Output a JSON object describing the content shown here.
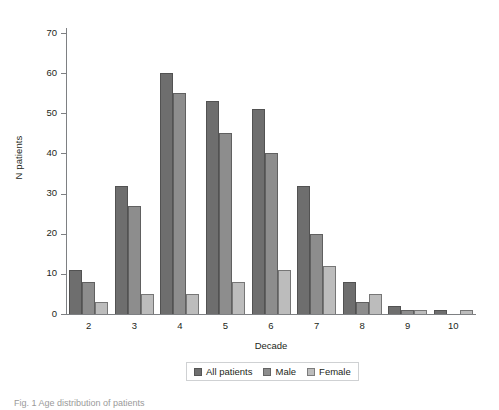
{
  "chart_data": {
    "type": "bar",
    "title": "",
    "subtitle": "",
    "xlabel": "Decade",
    "ylabel": "N patients",
    "categories": [
      "2",
      "3",
      "4",
      "5",
      "6",
      "7",
      "8",
      "9",
      "10"
    ],
    "series": [
      {
        "name": "All patients",
        "color": "#6e6e6e",
        "values": [
          11,
          32,
          60,
          53,
          51,
          32,
          8,
          2,
          1
        ]
      },
      {
        "name": "Male",
        "color": "#8d8d8d",
        "values": [
          8,
          27,
          55,
          45,
          40,
          20,
          3,
          1,
          0
        ]
      },
      {
        "name": "Female",
        "color": "#bcbcbc",
        "values": [
          3,
          5,
          5,
          8,
          11,
          12,
          5,
          1,
          1
        ]
      }
    ],
    "ylim": [
      0,
      70
    ],
    "yticks": [
      0,
      10,
      20,
      30,
      40,
      50,
      60,
      70
    ],
    "ytick_labels": [
      "0",
      "10",
      "20",
      "30",
      "40",
      "50",
      "60",
      "70"
    ],
    "grid": false,
    "legend_position": "bottom-center",
    "legend_entries": [
      "All patients",
      "Male",
      "Female"
    ],
    "axis_color": "#7e8083",
    "background": "#ffffff"
  },
  "caption": {
    "cropped_text": "Fig. 1  Age distribution of patients"
  }
}
